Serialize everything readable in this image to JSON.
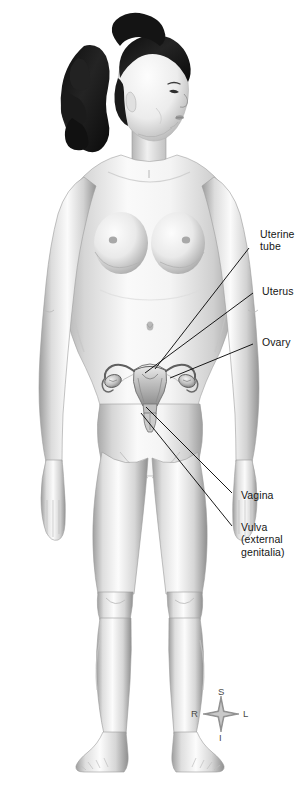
{
  "figure": {
    "background_color": "#ffffff"
  },
  "labels": [
    {
      "id": "uterine-tube",
      "lines": [
        "Uterine",
        "tube"
      ],
      "line1": "Uterine",
      "line2": "tube",
      "text_x": 260,
      "text_y": 228,
      "leader": {
        "x1": 249,
        "y1": 248,
        "x2": 155,
        "y2": 369
      }
    },
    {
      "id": "uterus",
      "lines": [
        "Uterus"
      ],
      "line1": "Uterus",
      "text_x": 262,
      "text_y": 285,
      "leader": {
        "x1": 253,
        "y1": 293,
        "x2": 145,
        "y2": 373
      }
    },
    {
      "id": "ovary",
      "lines": [
        "Ovary"
      ],
      "line1": "Ovary",
      "text_x": 262,
      "text_y": 336,
      "leader": {
        "x1": 253,
        "y1": 344,
        "x2": 170,
        "y2": 378
      }
    },
    {
      "id": "vagina",
      "lines": [
        "Vagina"
      ],
      "line1": "Vagina",
      "text_x": 241,
      "text_y": 489,
      "leader": {
        "x1": 232,
        "y1": 493,
        "x2": 144,
        "y2": 406
      }
    },
    {
      "id": "vulva",
      "lines": [
        "Vulva",
        "(external",
        "genitalia)"
      ],
      "line1": "Vulva",
      "line2": "(external",
      "line3": "genitalia)",
      "text_x": 241,
      "text_y": 521,
      "leader": {
        "x1": 232,
        "y1": 526,
        "x2": 140,
        "y2": 412
      }
    }
  ],
  "compass": {
    "center_x": 221,
    "center_y": 714,
    "superior": "S",
    "inferior": "I",
    "right": "R",
    "left": "L",
    "star_color": "#8a8a8a",
    "text_color": "#4a4a4a"
  },
  "colors": {
    "skin_light": "#fbfbfb",
    "skin_mid": "#e2e2e2",
    "skin_shadow": "#b4b4b4",
    "skin_deep": "#8e8e8e",
    "hair_dark": "#151515",
    "hair_mid": "#3a3a3a",
    "organ_light": "#d8d8d8",
    "organ_mid": "#a8a8a8",
    "organ_dark": "#6f6f6f",
    "leader_line": "#000000",
    "label_text": "#151515"
  }
}
